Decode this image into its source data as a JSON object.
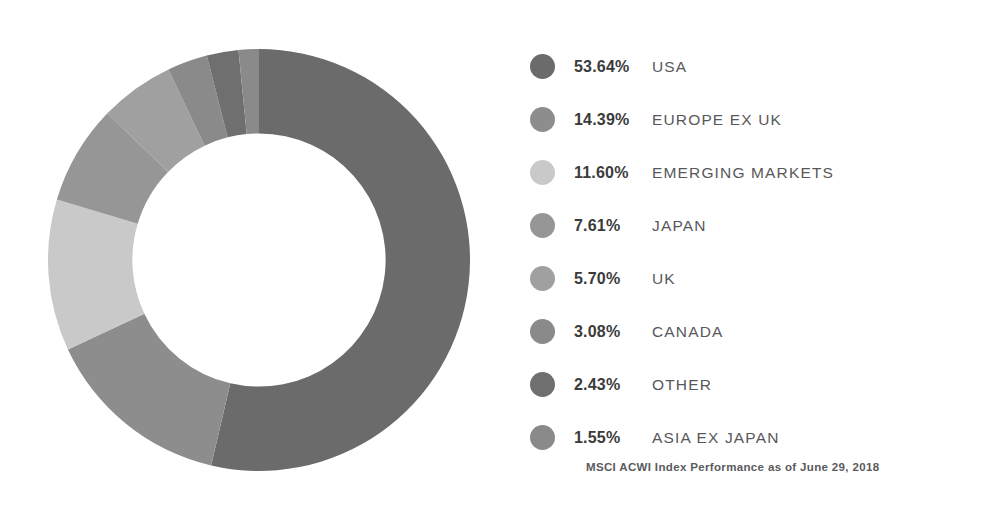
{
  "chart_data": {
    "type": "pie",
    "variant": "donut",
    "title": "",
    "subtitle": "",
    "xlabel": "",
    "ylabel": "",
    "legend_position": "right",
    "grid": false,
    "units": "percent",
    "start_angle_deg": 0,
    "direction": "clockwise",
    "inner_radius_ratio": 0.6,
    "total": 100.0,
    "categories": [
      "USA",
      "EUROPE EX UK",
      "EMERGING MARKETS",
      "JAPAN",
      "UK",
      "CANADA",
      "OTHER",
      "ASIA EX JAPAN"
    ],
    "values": [
      53.64,
      14.39,
      11.6,
      7.61,
      5.7,
      3.08,
      2.43,
      1.55
    ],
    "value_labels": [
      "53.64%",
      "14.39%",
      "11.60%",
      "7.61%",
      "5.70%",
      "3.08%",
      "2.43%",
      "1.55%"
    ],
    "colors": [
      "#6b6b6b",
      "#8d8d8d",
      "#c9c9c9",
      "#969696",
      "#a0a0a0",
      "#8a8a8a",
      "#6f6f6f",
      "#8a8a8a"
    ],
    "annotations": [
      "MSCI ACWI Index Performance as of June 29, 2018"
    ]
  },
  "legend": {
    "items": [
      {
        "pct": "53.64%",
        "label": "USA",
        "color": "#6b6b6b",
        "value": 53.64
      },
      {
        "pct": "14.39%",
        "label": "EUROPE EX UK",
        "color": "#8d8d8d",
        "value": 14.39
      },
      {
        "pct": "11.60%",
        "label": "EMERGING MARKETS",
        "color": "#c9c9c9",
        "value": 11.6
      },
      {
        "pct": "7.61%",
        "label": "JAPAN",
        "color": "#969696",
        "value": 7.61
      },
      {
        "pct": "5.70%",
        "label": "UK",
        "color": "#a0a0a0",
        "value": 5.7
      },
      {
        "pct": "3.08%",
        "label": "CANADA",
        "color": "#8a8a8a",
        "value": 3.08
      },
      {
        "pct": "2.43%",
        "label": "OTHER",
        "color": "#6f6f6f",
        "value": 2.43
      },
      {
        "pct": "1.55%",
        "label": "ASIA EX JAPAN",
        "color": "#8a8a8a",
        "value": 1.55
      }
    ]
  },
  "footnote": {
    "text": "MSCI ACWI Index Performance as of June 29, 2018"
  },
  "theme": {
    "background": "#ffffff",
    "pct_color": "#3b3b3b",
    "label_color": "#58585a",
    "footnote_color": "#5a5a5c"
  }
}
